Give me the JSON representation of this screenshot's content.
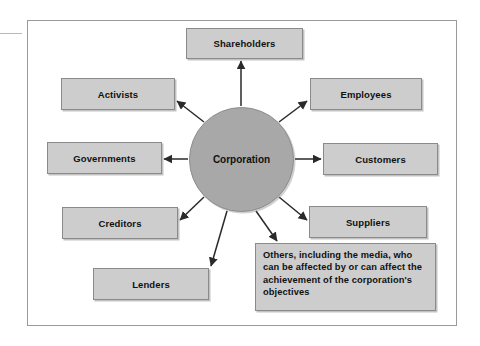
{
  "figure": {
    "type": "hub-and-spoke stakeholder diagram",
    "hub": {
      "label": "Corporation",
      "shape": "circle",
      "fill": "#a8a8a8"
    },
    "colors": {
      "box_fill": "#cdcdcd",
      "box_border": "#8a8a8a",
      "hub_fill": "#a8a8a8",
      "frame_border": "#9a9a9a",
      "text": "#111111",
      "arrow": "#2a2a2a",
      "background": "#ffffff"
    },
    "nodes": [
      {
        "id": "shareholders",
        "label": "Shareholders",
        "side": "top"
      },
      {
        "id": "activists",
        "label": "Activists",
        "side": "upper-left"
      },
      {
        "id": "employees",
        "label": "Employees",
        "side": "upper-right"
      },
      {
        "id": "governments",
        "label": "Governments",
        "side": "left"
      },
      {
        "id": "customers",
        "label": "Customers",
        "side": "right"
      },
      {
        "id": "creditors",
        "label": "Creditors",
        "side": "lower-left"
      },
      {
        "id": "suppliers",
        "label": "Suppliers",
        "side": "lower-right"
      },
      {
        "id": "lenders",
        "label": "Lenders",
        "side": "bottom-left"
      },
      {
        "id": "others",
        "label": "Others, including the media, who can be affected by or can affect the achievement of the corporation's objectives",
        "side": "bottom-right"
      }
    ],
    "arrow_count": 9,
    "arrow_direction": "from hub outward to each stakeholder"
  }
}
